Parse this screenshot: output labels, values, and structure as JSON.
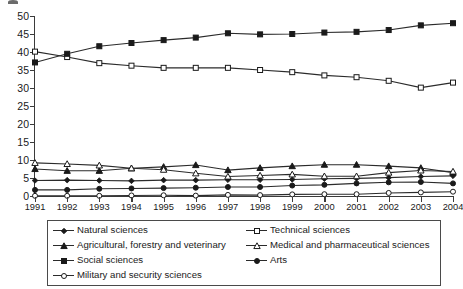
{
  "chart_data": {
    "type": "line",
    "title": "",
    "subtitle": "",
    "xlabel": "",
    "ylabel": "",
    "categories": [
      "1991",
      "1992",
      "1993",
      "1994",
      "1995",
      "1996",
      "1997",
      "1998",
      "1999",
      "2000",
      "2001",
      "2002",
      "2003",
      "2004"
    ],
    "x": [
      1991,
      1992,
      1993,
      1994,
      1995,
      1996,
      1997,
      1998,
      1999,
      2000,
      2001,
      2002,
      2003,
      2004
    ],
    "ylim": [
      0,
      50
    ],
    "y_ticks": [
      0,
      5,
      10,
      15,
      20,
      25,
      30,
      35,
      40,
      45,
      50
    ],
    "grid": false,
    "legend_position": "bottom",
    "series": [
      {
        "name": "Natural sciences",
        "marker": "filled-diamond",
        "values": [
          4.3,
          4.4,
          4.3,
          4.2,
          4.4,
          4.4,
          4.5,
          4.5,
          4.6,
          4.8,
          4.9,
          5.1,
          5.4,
          5.6
        ]
      },
      {
        "name": "Technical sciences",
        "marker": "open-square",
        "values": [
          40.1,
          38.6,
          36.9,
          36.2,
          35.6,
          35.6,
          35.6,
          35.0,
          34.4,
          33.5,
          33.0,
          32.0,
          30.1,
          31.5
        ]
      },
      {
        "name": "Agricultural, forestry and veterinary",
        "marker": "filled-triangle",
        "values": [
          7.5,
          7.0,
          7.0,
          7.7,
          8.1,
          8.6,
          7.2,
          7.8,
          8.3,
          8.7,
          8.7,
          8.3,
          7.8,
          6.5
        ]
      },
      {
        "name": "Medical and pharmaceutical sciences",
        "marker": "open-triangle",
        "values": [
          9.2,
          8.9,
          8.5,
          7.7,
          7.3,
          6.3,
          5.4,
          5.7,
          6.0,
          5.5,
          5.5,
          6.5,
          7.1,
          6.8
        ]
      },
      {
        "name": "Social sciences",
        "marker": "filled-square",
        "values": [
          37.1,
          39.5,
          41.6,
          42.5,
          43.3,
          44.0,
          45.2,
          44.9,
          45.0,
          45.4,
          45.6,
          46.1,
          47.4,
          48.0
        ]
      },
      {
        "name": "Arts",
        "marker": "filled-circle",
        "values": [
          1.7,
          1.7,
          2.0,
          2.1,
          2.2,
          2.3,
          2.5,
          2.5,
          2.9,
          3.1,
          3.5,
          3.8,
          3.9,
          3.5
        ]
      },
      {
        "name": "Military and security sciences",
        "marker": "open-circle",
        "values": [
          0.05,
          0.05,
          0.05,
          0.15,
          0.2,
          0.1,
          0.3,
          0.25,
          0.45,
          0.5,
          0.5,
          0.85,
          1.0,
          1.2
        ]
      }
    ]
  },
  "legend": {
    "items": [
      {
        "label": "Natural sciences",
        "marker": "filled-diamond"
      },
      {
        "label": "Technical sciences",
        "marker": "open-square"
      },
      {
        "label": "Agricultural, forestry and veterinary",
        "marker": "filled-triangle"
      },
      {
        "label": "Medical and pharmaceutical sciences",
        "marker": "open-triangle"
      },
      {
        "label": "Social sciences",
        "marker": "filled-square"
      },
      {
        "label": "Arts",
        "marker": "filled-circle"
      },
      {
        "label": "Military and security sciences",
        "marker": "open-circle"
      }
    ]
  },
  "colors": {
    "line": "#2b2b2b",
    "axis": "#3b3b3b",
    "text": "#1a1a1a",
    "marker_fill": "#1a1a1a",
    "marker_open_fill": "#ffffff",
    "legend_border": "#4a4a4a",
    "background": "#ffffff"
  }
}
